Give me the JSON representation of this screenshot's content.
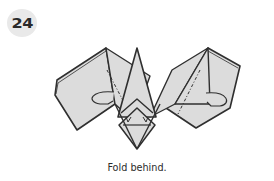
{
  "step": {
    "number": "24"
  },
  "diagram": {
    "paper_color": "#dcdcdc",
    "line_color": "#2f2f2f",
    "fold_line_style": "dash-dot mountain fold"
  },
  "caption": {
    "text": "Fold behind."
  },
  "colors": {
    "background": "#ffffff",
    "badge": "#e9e9e9",
    "text": "#2b2b2b"
  }
}
